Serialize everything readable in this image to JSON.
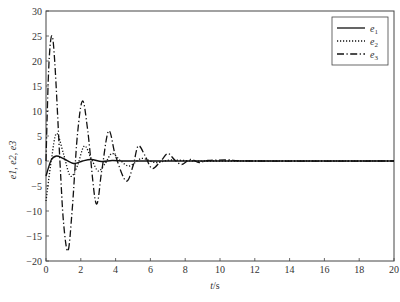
{
  "chart_data": {
    "type": "line",
    "title": "",
    "xlabel": "t/s",
    "ylabel": "e1, e2, e3",
    "xlim": [
      0,
      20
    ],
    "ylim": [
      -20,
      30
    ],
    "xticks": [
      0,
      2,
      4,
      6,
      8,
      10,
      12,
      14,
      16,
      18,
      20
    ],
    "yticks": [
      -20,
      -15,
      -10,
      -5,
      0,
      5,
      10,
      15,
      20,
      25,
      30
    ],
    "grid": false,
    "legend_position": "upper right",
    "series": [
      {
        "name": "e1",
        "style": "solid",
        "x": [
          0,
          0.3,
          0.6,
          1.0,
          1.6,
          2.1,
          2.6,
          3.2,
          3.8,
          4.5,
          5.5,
          7,
          10,
          20
        ],
        "values": [
          -3,
          0.2,
          1.0,
          0.5,
          -0.5,
          0.0,
          0.3,
          -0.1,
          0.1,
          0.0,
          0.0,
          0.0,
          0.0,
          0.0
        ]
      },
      {
        "name": "e2",
        "style": "dotted",
        "x": [
          0,
          0.3,
          0.6,
          1.0,
          1.4,
          1.8,
          2.2,
          2.6,
          3.0,
          3.4,
          3.8,
          4.3,
          4.8,
          5.5,
          6.3,
          7.2,
          8.5,
          10,
          20
        ],
        "values": [
          -8,
          0,
          5.5,
          1.5,
          -3,
          -1,
          3,
          0.5,
          -2,
          -0.5,
          1.5,
          0,
          -1,
          0.5,
          -0.3,
          0.2,
          0,
          0,
          0
        ]
      },
      {
        "name": "e3",
        "style": "dash-dot",
        "x": [
          0,
          0.15,
          0.32,
          0.5,
          0.8,
          1.0,
          1.26,
          1.5,
          1.8,
          2.1,
          2.4,
          2.87,
          3.2,
          3.6,
          4.0,
          4.6,
          5.0,
          5.3,
          5.7,
          6.1,
          6.6,
          7.0,
          7.4,
          7.8,
          8.3,
          8.8,
          9.3,
          10.5,
          12,
          20
        ],
        "values": [
          0,
          18,
          25,
          20,
          0,
          -12,
          -18,
          -10,
          5,
          12,
          6,
          -8.4,
          -2,
          6,
          1,
          -4,
          -1,
          3,
          1,
          -1.5,
          0,
          1.5,
          0.2,
          -0.7,
          0.3,
          -0.3,
          0.1,
          0.2,
          0,
          0
        ]
      }
    ]
  },
  "legend": {
    "items": [
      {
        "label": "e",
        "sub": "1",
        "style": "solid"
      },
      {
        "label": "e",
        "sub": "2",
        "style": "dotted"
      },
      {
        "label": "e",
        "sub": "3",
        "style": "dash-dot"
      }
    ]
  },
  "axes": {
    "xlabel_italic": "t",
    "xlabel_rest": "/s",
    "ylabel_text": "e1, e2, e3"
  },
  "colors": {
    "line": "#111111",
    "axis": "#444444",
    "background": "#ffffff"
  }
}
